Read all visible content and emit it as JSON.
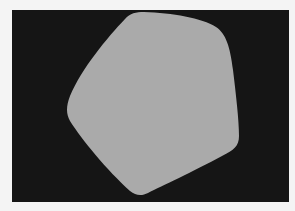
{
  "scene": {
    "background_color": "#f4f4f4",
    "panel_color": "#151515",
    "shape": {
      "type": "rounded-pentagon",
      "fill": "#aaaaaa"
    }
  }
}
